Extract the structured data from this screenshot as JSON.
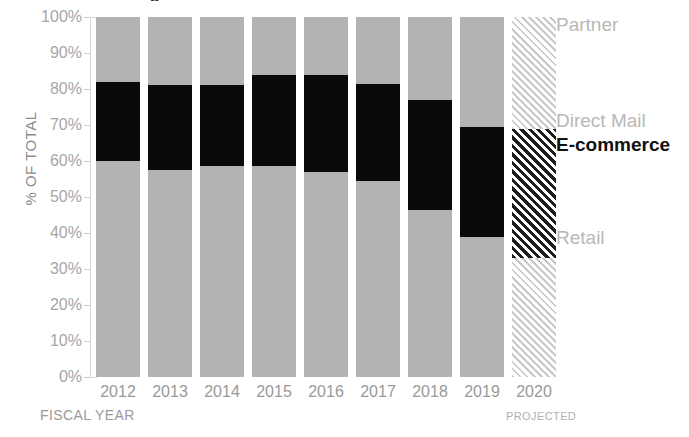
{
  "chart_data": {
    "type": "bar",
    "subtype": "stacked-100-percent",
    "title": "",
    "title_fragment_visible": "s",
    "xlabel": "FISCAL YEAR",
    "ylabel": "% OF TOTAL",
    "ylim": [
      0,
      100
    ],
    "ytick_labels": [
      "100%",
      "90%",
      "80%",
      "70%",
      "60%",
      "50%",
      "40%",
      "30%",
      "20%",
      "10%",
      "0%"
    ],
    "ytick_values": [
      100,
      90,
      80,
      70,
      60,
      50,
      40,
      30,
      20,
      10,
      0
    ],
    "grid": false,
    "legend_position": "right",
    "categories": [
      "2012",
      "2013",
      "2014",
      "2015",
      "2016",
      "2017",
      "2018",
      "2019",
      "2020"
    ],
    "projected_categories": [
      "2020"
    ],
    "projected_note": "PROJECTED",
    "series": [
      {
        "name": "Retail",
        "color": "#b3b3b3",
        "values": [
          60.0,
          57.5,
          58.5,
          58.5,
          57.0,
          54.5,
          46.5,
          39.0,
          33.0
        ]
      },
      {
        "name": "E-commerce",
        "color": "#0a0a0a",
        "values": [
          22.0,
          23.5,
          22.5,
          25.5,
          27.0,
          27.0,
          30.5,
          30.5,
          36.0
        ]
      },
      {
        "name": "Direct Mail",
        "color": "#b3b3b3",
        "values": [
          2.5,
          2.0,
          2.0,
          1.5,
          1.5,
          2.5,
          2.0,
          2.0,
          0.0
        ]
      },
      {
        "name": "Partner",
        "color": "#b3b3b3",
        "values": [
          15.5,
          17.0,
          17.0,
          14.5,
          14.5,
          16.0,
          21.0,
          28.5,
          31.0
        ]
      }
    ]
  },
  "legend": {
    "items": [
      {
        "label": "Partner",
        "emphasis": false,
        "top": 14
      },
      {
        "label": "Direct Mail",
        "emphasis": false,
        "top": 110
      },
      {
        "label": "E-commerce",
        "emphasis": true,
        "top": 134
      },
      {
        "label": "Retail",
        "emphasis": false,
        "top": 227
      }
    ]
  },
  "colors": {
    "gray": "#b3b3b3",
    "black": "#0a0a0a",
    "axis": "#d8d8d8",
    "tick_text": "#a6a6a6",
    "label_text": "#9a9a9a"
  }
}
